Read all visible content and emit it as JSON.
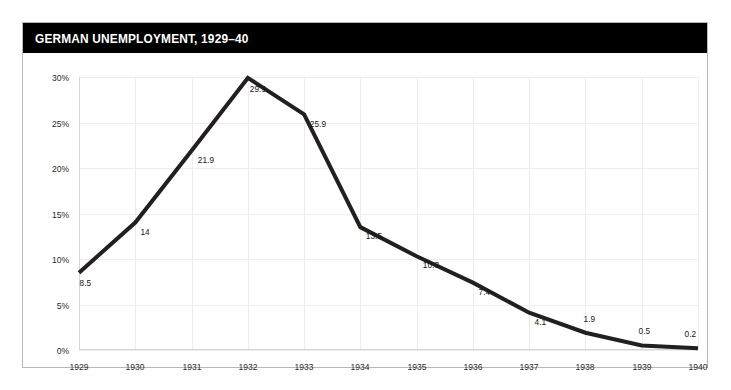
{
  "figure": {
    "title": "GERMAN UNEMPLOYMENT, 1929–40",
    "title_bar_color": "#000000",
    "title_text_color": "#ffffff",
    "frame_border_color": "#b8b8b8",
    "background": "#ffffff"
  },
  "chart_data": {
    "type": "line",
    "title": "GERMAN UNEMPLOYMENT, 1929–40",
    "xlabel": "",
    "ylabel": "",
    "categories": [
      "1929",
      "1930",
      "1931",
      "1932",
      "1933",
      "1934",
      "1935",
      "1936",
      "1937",
      "1938",
      "1939",
      "1940"
    ],
    "values": [
      8.5,
      14,
      21.9,
      29.9,
      25.9,
      13.5,
      10.3,
      7.4,
      4.1,
      1.9,
      0.5,
      0.2
    ],
    "point_labels": [
      "8.5",
      "14",
      "21.9",
      "29.9",
      "25.9",
      "13.5",
      "10.3",
      "7.4",
      "4.1",
      "1.9",
      "0.5",
      "0.2"
    ],
    "ylim": [
      0,
      30
    ],
    "xlim": [
      "1929",
      "1940"
    ],
    "yticks": [
      0,
      5,
      10,
      15,
      20,
      25,
      30
    ],
    "ytick_labels": [
      "0%",
      "5%",
      "10%",
      "15%",
      "20%",
      "25%",
      "30%"
    ],
    "xtick_labels": [
      "1929",
      "1930",
      "1931",
      "1932",
      "1933",
      "1934",
      "1935",
      "1936",
      "1937",
      "1938",
      "1939",
      "1940"
    ],
    "grid": true,
    "gridline_color": "#ededed",
    "legend": null,
    "legend_position": "none",
    "series_color": "#231f20",
    "series_line_width": 4,
    "units": "percent"
  }
}
